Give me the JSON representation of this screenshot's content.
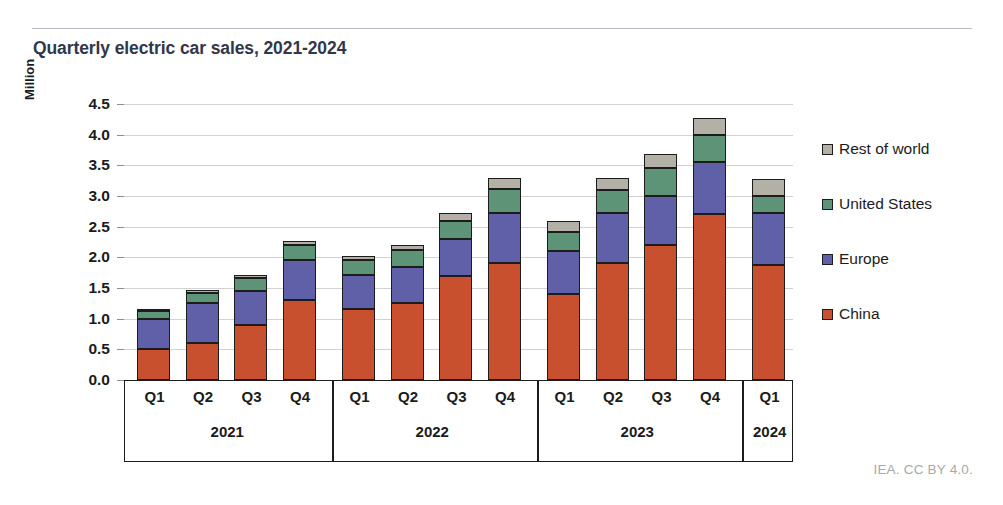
{
  "header": {
    "title": "Quarterly electric car sales, 2021-2024"
  },
  "footer": {
    "credit": "IEA. CC BY 4.0."
  },
  "chart_data": {
    "type": "bar",
    "stacked": true,
    "title": "Quarterly electric car sales, 2021-2024",
    "xlabel": "",
    "ylabel": "Million",
    "ylim": [
      0.0,
      4.5
    ],
    "yticks": [
      "0.0",
      "0.5",
      "1.0",
      "1.5",
      "2.0",
      "2.5",
      "3.0",
      "3.5",
      "4.0",
      "4.5"
    ],
    "grid": true,
    "legend_position": "right",
    "categories": [
      "Q1 2021",
      "Q2 2021",
      "Q3 2021",
      "Q4 2021",
      "Q1 2022",
      "Q2 2022",
      "Q3 2022",
      "Q4 2022",
      "Q1 2023",
      "Q2 2023",
      "Q3 2023",
      "Q4 2023",
      "Q1 2024"
    ],
    "quarter_labels": [
      "Q1",
      "Q2",
      "Q3",
      "Q4",
      "Q1",
      "Q2",
      "Q3",
      "Q4",
      "Q1",
      "Q2",
      "Q3",
      "Q4",
      "Q1"
    ],
    "year_groups": [
      {
        "label": "2021",
        "count": 4
      },
      {
        "label": "2022",
        "count": 4
      },
      {
        "label": "2023",
        "count": 4
      },
      {
        "label": "2024",
        "count": 1
      }
    ],
    "series": [
      {
        "name": "China",
        "color": "#c9502f",
        "values": [
          0.5,
          0.6,
          0.9,
          1.3,
          1.15,
          1.25,
          1.7,
          1.9,
          1.4,
          1.9,
          2.2,
          2.7,
          1.88
        ]
      },
      {
        "name": "Europe",
        "color": "#5f60a8",
        "values": [
          0.5,
          0.65,
          0.55,
          0.65,
          0.57,
          0.6,
          0.6,
          0.82,
          0.7,
          0.82,
          0.8,
          0.85,
          0.84
        ]
      },
      {
        "name": "United States",
        "color": "#5d9478",
        "values": [
          0.12,
          0.17,
          0.22,
          0.25,
          0.23,
          0.27,
          0.3,
          0.4,
          0.32,
          0.38,
          0.45,
          0.45,
          0.28
        ]
      },
      {
        "name": "Rest of world",
        "color": "#b3b0a5",
        "values": [
          0.03,
          0.05,
          0.05,
          0.07,
          0.07,
          0.08,
          0.12,
          0.18,
          0.18,
          0.2,
          0.23,
          0.28,
          0.28
        ]
      }
    ],
    "legend_order_top_to_bottom": [
      "Rest of world",
      "United States",
      "Europe",
      "China"
    ],
    "totals": [
      1.15,
      1.47,
      1.72,
      2.27,
      2.02,
      2.2,
      2.72,
      3.3,
      2.6,
      3.3,
      3.68,
      4.28,
      3.28
    ]
  }
}
